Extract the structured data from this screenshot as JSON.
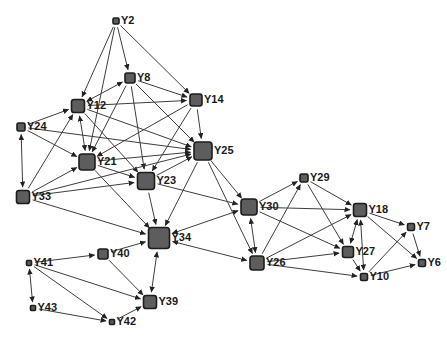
{
  "figure": {
    "background_color": "#ffffff",
    "width": 447,
    "height": 343
  },
  "styles": {
    "node_fill": "#5d5d5d",
    "node_border": "#1c1c1c",
    "edge_color": "#3e3e3e",
    "label_color": "#1a1a1a",
    "arrow_color": "#222222"
  },
  "chart_data": {
    "type": "network",
    "title": "",
    "nodes": [
      {
        "id": "Y2",
        "label": "Y2",
        "x": 116,
        "y": 21,
        "size": 6
      },
      {
        "id": "Y8",
        "label": "Y8",
        "x": 130,
        "y": 78,
        "size": 10
      },
      {
        "id": "Y12",
        "label": "Y12",
        "x": 78,
        "y": 106,
        "size": 13
      },
      {
        "id": "Y14",
        "label": "Y14",
        "x": 196,
        "y": 100,
        "size": 12
      },
      {
        "id": "Y24",
        "label": "Y24",
        "x": 21,
        "y": 127,
        "size": 8
      },
      {
        "id": "Y21",
        "label": "Y21",
        "x": 87,
        "y": 162,
        "size": 16
      },
      {
        "id": "Y25",
        "label": "Y25",
        "x": 203,
        "y": 151,
        "size": 18
      },
      {
        "id": "Y23",
        "label": "Y23",
        "x": 146,
        "y": 181,
        "size": 17
      },
      {
        "id": "Y33",
        "label": "Y33",
        "x": 23,
        "y": 197,
        "size": 13
      },
      {
        "id": "Y34",
        "label": "Y34",
        "x": 159,
        "y": 238,
        "size": 21
      },
      {
        "id": "Y40",
        "label": "Y40",
        "x": 103,
        "y": 254,
        "size": 10
      },
      {
        "id": "Y41",
        "label": "Y41",
        "x": 29,
        "y": 263,
        "size": 5
      },
      {
        "id": "Y43",
        "label": "Y43",
        "x": 33,
        "y": 308,
        "size": 5
      },
      {
        "id": "Y42",
        "label": "Y42",
        "x": 112,
        "y": 322,
        "size": 5
      },
      {
        "id": "Y39",
        "label": "Y39",
        "x": 150,
        "y": 302,
        "size": 13
      },
      {
        "id": "Y30",
        "label": "Y30",
        "x": 249,
        "y": 207,
        "size": 16
      },
      {
        "id": "Y26",
        "label": "Y26",
        "x": 257,
        "y": 263,
        "size": 14
      },
      {
        "id": "Y29",
        "label": "Y29",
        "x": 304,
        "y": 178,
        "size": 8
      },
      {
        "id": "Y18",
        "label": "Y18",
        "x": 360,
        "y": 210,
        "size": 13
      },
      {
        "id": "Y27",
        "label": "Y27",
        "x": 348,
        "y": 252,
        "size": 11
      },
      {
        "id": "Y10",
        "label": "Y10",
        "x": 364,
        "y": 277,
        "size": 7
      },
      {
        "id": "Y7",
        "label": "Y7",
        "x": 411,
        "y": 227,
        "size": 7
      },
      {
        "id": "Y6",
        "label": "Y6",
        "x": 422,
        "y": 263,
        "size": 7
      }
    ],
    "edges": [
      {
        "from": "Y2",
        "to": "Y12",
        "dir": "one"
      },
      {
        "from": "Y2",
        "to": "Y21",
        "dir": "one"
      },
      {
        "from": "Y2",
        "to": "Y8",
        "dir": "one"
      },
      {
        "from": "Y2",
        "to": "Y14",
        "dir": "one"
      },
      {
        "from": "Y8",
        "to": "Y12",
        "dir": "both"
      },
      {
        "from": "Y8",
        "to": "Y14",
        "dir": "one"
      },
      {
        "from": "Y8",
        "to": "Y25",
        "dir": "one"
      },
      {
        "from": "Y8",
        "to": "Y23",
        "dir": "one"
      },
      {
        "from": "Y8",
        "to": "Y21",
        "dir": "one"
      },
      {
        "from": "Y12",
        "to": "Y14",
        "dir": "one"
      },
      {
        "from": "Y12",
        "to": "Y25",
        "dir": "one"
      },
      {
        "from": "Y12",
        "to": "Y23",
        "dir": "one"
      },
      {
        "from": "Y21",
        "to": "Y12",
        "dir": "both"
      },
      {
        "from": "Y24",
        "to": "Y12",
        "dir": "one"
      },
      {
        "from": "Y24",
        "to": "Y21",
        "dir": "one"
      },
      {
        "from": "Y24",
        "to": "Y25",
        "dir": "one"
      },
      {
        "from": "Y24",
        "to": "Y33",
        "dir": "both"
      },
      {
        "from": "Y14",
        "to": "Y25",
        "dir": "one"
      },
      {
        "from": "Y14",
        "to": "Y23",
        "dir": "one"
      },
      {
        "from": "Y14",
        "to": "Y21",
        "dir": "one"
      },
      {
        "from": "Y33",
        "to": "Y21",
        "dir": "one"
      },
      {
        "from": "Y33",
        "to": "Y12",
        "dir": "one"
      },
      {
        "from": "Y33",
        "to": "Y23",
        "dir": "one"
      },
      {
        "from": "Y33",
        "to": "Y25",
        "dir": "one"
      },
      {
        "from": "Y33",
        "to": "Y34",
        "dir": "one"
      },
      {
        "from": "Y21",
        "to": "Y23",
        "dir": "one"
      },
      {
        "from": "Y21",
        "to": "Y25",
        "dir": "one"
      },
      {
        "from": "Y21",
        "to": "Y34",
        "dir": "one"
      },
      {
        "from": "Y23",
        "to": "Y25",
        "dir": "one"
      },
      {
        "from": "Y23",
        "to": "Y34",
        "dir": "one"
      },
      {
        "from": "Y23",
        "to": "Y30",
        "dir": "one"
      },
      {
        "from": "Y25",
        "to": "Y30",
        "dir": "one"
      },
      {
        "from": "Y25",
        "to": "Y26",
        "dir": "one"
      },
      {
        "from": "Y25",
        "to": "Y34",
        "dir": "one"
      },
      {
        "from": "Y30",
        "to": "Y34",
        "dir": "both"
      },
      {
        "from": "Y30",
        "to": "Y26",
        "dir": "both"
      },
      {
        "from": "Y30",
        "to": "Y18",
        "dir": "one"
      },
      {
        "from": "Y30",
        "to": "Y29",
        "dir": "one"
      },
      {
        "from": "Y30",
        "to": "Y27",
        "dir": "one"
      },
      {
        "from": "Y26",
        "to": "Y29",
        "dir": "one"
      },
      {
        "from": "Y26",
        "to": "Y27",
        "dir": "one"
      },
      {
        "from": "Y26",
        "to": "Y18",
        "dir": "one"
      },
      {
        "from": "Y26",
        "to": "Y10",
        "dir": "one"
      },
      {
        "from": "Y26",
        "to": "Y34",
        "dir": "both"
      },
      {
        "from": "Y29",
        "to": "Y18",
        "dir": "one"
      },
      {
        "from": "Y29",
        "to": "Y27",
        "dir": "one"
      },
      {
        "from": "Y27",
        "to": "Y18",
        "dir": "both"
      },
      {
        "from": "Y27",
        "to": "Y10",
        "dir": "one"
      },
      {
        "from": "Y10",
        "to": "Y18",
        "dir": "both"
      },
      {
        "from": "Y10",
        "to": "Y7",
        "dir": "one"
      },
      {
        "from": "Y10",
        "to": "Y6",
        "dir": "one"
      },
      {
        "from": "Y18",
        "to": "Y7",
        "dir": "one"
      },
      {
        "from": "Y18",
        "to": "Y6",
        "dir": "one"
      },
      {
        "from": "Y7",
        "to": "Y6",
        "dir": "one"
      },
      {
        "from": "Y40",
        "to": "Y34",
        "dir": "one"
      },
      {
        "from": "Y40",
        "to": "Y39",
        "dir": "one"
      },
      {
        "from": "Y41",
        "to": "Y40",
        "dir": "one"
      },
      {
        "from": "Y41",
        "to": "Y39",
        "dir": "one"
      },
      {
        "from": "Y41",
        "to": "Y42",
        "dir": "one"
      },
      {
        "from": "Y41",
        "to": "Y43",
        "dir": "both"
      },
      {
        "from": "Y43",
        "to": "Y42",
        "dir": "one"
      },
      {
        "from": "Y42",
        "to": "Y39",
        "dir": "one"
      },
      {
        "from": "Y39",
        "to": "Y34",
        "dir": "both"
      }
    ]
  }
}
